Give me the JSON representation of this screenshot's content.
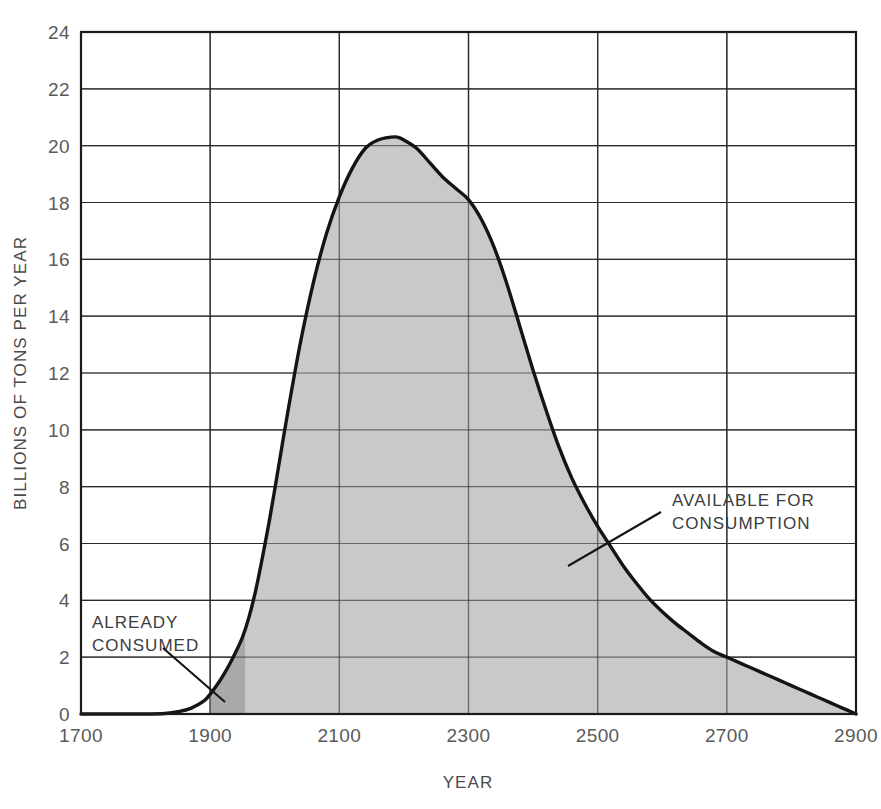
{
  "figure": {
    "background_color": "#ffffff",
    "plot": {
      "x_left": 81,
      "x_right": 856,
      "y_top": 32,
      "y_bottom": 714
    }
  },
  "chart_data": {
    "type": "area",
    "title": "",
    "subtitle": "",
    "xlabel": "YEAR",
    "ylabel": "BILLIONS OF TONS PER YEAR",
    "xlim": [
      1700,
      2900
    ],
    "ylim": [
      0,
      24
    ],
    "xticks": [
      1700,
      1900,
      2100,
      2300,
      2500,
      2700,
      2900
    ],
    "yticks": [
      0,
      2,
      4,
      6,
      8,
      10,
      12,
      14,
      16,
      18,
      20,
      22,
      24
    ],
    "xtick_labels": [
      "1700",
      "1900",
      "2100",
      "2300",
      "2500",
      "2700",
      "2900"
    ],
    "ytick_labels": [
      "0",
      "2",
      "4",
      "6",
      "8",
      "10",
      "12",
      "14",
      "16",
      "18",
      "20",
      "22",
      "24"
    ],
    "grid": true,
    "legend": "none",
    "series": [
      {
        "name": "Fossil fuel production rate",
        "fill_color": "#c9c9c9",
        "line_color": "#141414",
        "x": [
          1700,
          1750,
          1800,
          1830,
          1850,
          1870,
          1890,
          1900,
          1910,
          1920,
          1930,
          1940,
          1950,
          1960,
          1970,
          1980,
          1990,
          2000,
          2020,
          2040,
          2060,
          2080,
          2100,
          2120,
          2140,
          2160,
          2180,
          2190,
          2200,
          2220,
          2240,
          2260,
          2280,
          2300,
          2320,
          2340,
          2360,
          2380,
          2400,
          2420,
          2440,
          2460,
          2480,
          2500,
          2520,
          2540,
          2560,
          2580,
          2600,
          2620,
          2640,
          2660,
          2680,
          2700,
          2720,
          2740,
          2760,
          2780,
          2800,
          2820,
          2840,
          2860,
          2880,
          2900
        ],
        "y": [
          0.0,
          0.0,
          0.0,
          0.02,
          0.08,
          0.2,
          0.45,
          0.7,
          1.0,
          1.35,
          1.75,
          2.2,
          2.7,
          3.4,
          4.3,
          5.4,
          6.6,
          7.9,
          10.6,
          13.1,
          15.2,
          16.9,
          18.2,
          19.2,
          19.9,
          20.2,
          20.3,
          20.3,
          20.2,
          19.9,
          19.4,
          18.9,
          18.5,
          18.1,
          17.4,
          16.4,
          15.1,
          13.6,
          12.1,
          10.7,
          9.4,
          8.3,
          7.4,
          6.6,
          5.9,
          5.2,
          4.6,
          4.05,
          3.6,
          3.2,
          2.85,
          2.5,
          2.2,
          2.0,
          1.8,
          1.6,
          1.4,
          1.2,
          1.0,
          0.8,
          0.6,
          0.4,
          0.2,
          0.0
        ]
      }
    ],
    "regions": [
      {
        "name": "already-consumed",
        "label": "ALREADY CONSUMED",
        "x_start": 1900,
        "x_end": 1955,
        "fill_color": "#a9a9a9"
      },
      {
        "name": "available-for-consumption",
        "label": "AVAILABLE FOR CONSUMPTION",
        "x_start": 1955,
        "x_end": 2900,
        "fill_color": "#c9c9c9"
      }
    ],
    "annotations": [
      {
        "name": "already-consumed",
        "line1": "ALREADY",
        "line2": "CONSUMED",
        "text_x": 92,
        "text_y": 628,
        "leader_from_x": 163,
        "leader_from_y": 648,
        "leader_to_x": 225,
        "leader_to_y": 702
      },
      {
        "name": "available-for-consumption",
        "line1": "AVAILABLE FOR",
        "line2": "CONSUMPTION",
        "text_x": 672,
        "text_y": 506,
        "leader_from_x": 661,
        "leader_from_y": 512,
        "leader_to_x": 568,
        "leader_to_y": 566
      }
    ],
    "colors": {
      "axis": "#1a1a1a",
      "grid": "#2b2b2b",
      "curve": "#141414",
      "fill_available": "#c9c9c9",
      "fill_consumed": "#a9a9a9",
      "tick_text": "#5a5a5a"
    }
  }
}
